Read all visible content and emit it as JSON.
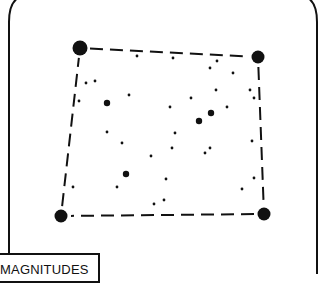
{
  "diagram": {
    "type": "star-field-chart",
    "frame": "rounded-rectangle",
    "colors": {
      "ink": "#111111",
      "background": "#ffffff"
    },
    "legend": {
      "title": "MAGNITUDES"
    },
    "corner_stars": [
      {
        "id": "top-left",
        "x": 80,
        "y": 48,
        "magnitude": "bright"
      },
      {
        "id": "top-right",
        "x": 258,
        "y": 57,
        "magnitude": "bright"
      },
      {
        "id": "bottom-right",
        "x": 264,
        "y": 214,
        "magnitude": "bright"
      },
      {
        "id": "bottom-left",
        "x": 61,
        "y": 216,
        "magnitude": "bright"
      }
    ],
    "boundary": {
      "style": "dashed",
      "connects": [
        "top-left",
        "top-right",
        "bottom-right",
        "bottom-left"
      ]
    },
    "field_stars": [
      {
        "x": 137,
        "y": 56,
        "size": "small"
      },
      {
        "x": 173,
        "y": 58,
        "size": "small"
      },
      {
        "x": 217,
        "y": 61,
        "size": "small"
      },
      {
        "x": 210,
        "y": 68,
        "size": "small"
      },
      {
        "x": 233,
        "y": 73,
        "size": "small"
      },
      {
        "x": 86,
        "y": 83,
        "size": "small"
      },
      {
        "x": 95,
        "y": 81,
        "size": "small"
      },
      {
        "x": 129,
        "y": 95,
        "size": "small"
      },
      {
        "x": 79,
        "y": 101,
        "size": "small"
      },
      {
        "x": 107,
        "y": 103,
        "size": "medium"
      },
      {
        "x": 191,
        "y": 98,
        "size": "small"
      },
      {
        "x": 216,
        "y": 90,
        "size": "small"
      },
      {
        "x": 250,
        "y": 90,
        "size": "small"
      },
      {
        "x": 254,
        "y": 98,
        "size": "small"
      },
      {
        "x": 170,
        "y": 107,
        "size": "small"
      },
      {
        "x": 227,
        "y": 107,
        "size": "small"
      },
      {
        "x": 211,
        "y": 113,
        "size": "medium"
      },
      {
        "x": 199,
        "y": 121,
        "size": "medium"
      },
      {
        "x": 107,
        "y": 132,
        "size": "small"
      },
      {
        "x": 175,
        "y": 133,
        "size": "small"
      },
      {
        "x": 122,
        "y": 143,
        "size": "small"
      },
      {
        "x": 172,
        "y": 148,
        "size": "small"
      },
      {
        "x": 151,
        "y": 156,
        "size": "small"
      },
      {
        "x": 205,
        "y": 153,
        "size": "small"
      },
      {
        "x": 210,
        "y": 148,
        "size": "small"
      },
      {
        "x": 252,
        "y": 141,
        "size": "small"
      },
      {
        "x": 126,
        "y": 174,
        "size": "medium"
      },
      {
        "x": 166,
        "y": 179,
        "size": "small"
      },
      {
        "x": 73,
        "y": 187,
        "size": "small"
      },
      {
        "x": 117,
        "y": 187,
        "size": "small"
      },
      {
        "x": 242,
        "y": 189,
        "size": "small"
      },
      {
        "x": 254,
        "y": 178,
        "size": "small"
      },
      {
        "x": 154,
        "y": 204,
        "size": "small"
      },
      {
        "x": 164,
        "y": 200,
        "size": "small"
      }
    ]
  }
}
